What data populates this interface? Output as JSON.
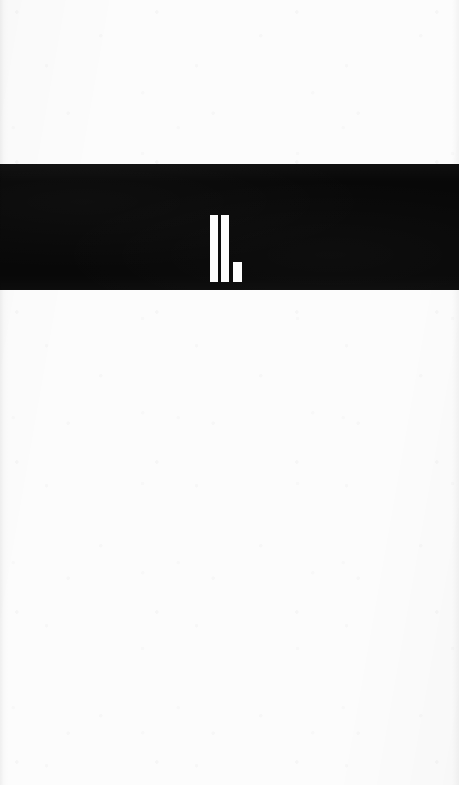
{
  "page": {
    "kind": "part-divider-page",
    "width": 459,
    "height": 785,
    "background_color": "#fcfcfc",
    "label": ""
  },
  "divider": {
    "band_color": "#080808",
    "band_top": 164,
    "band_height": 126,
    "numeral": {
      "text": "II.",
      "roman_value": "II",
      "arabic_value": "2",
      "terminator": ".",
      "color": "#fdfdfd",
      "strokes": [
        {
          "name": "stroke-1",
          "shape": "vertical-bar"
        },
        {
          "name": "stroke-2",
          "shape": "vertical-bar"
        },
        {
          "name": "period",
          "shape": "square"
        }
      ]
    }
  },
  "blank_top": {
    "label": ""
  },
  "blank_bottom": {
    "label": ""
  }
}
